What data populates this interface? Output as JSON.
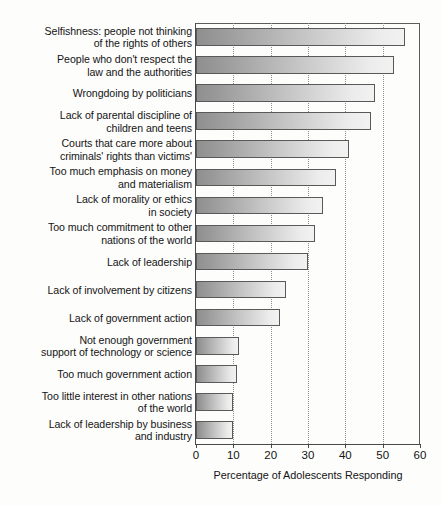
{
  "chart_data": {
    "type": "bar",
    "orientation": "horizontal",
    "title": "",
    "xlabel": "Percentage of Adolescents Responding",
    "ylabel": "",
    "xlim": [
      0,
      60
    ],
    "xticks": [
      0,
      10,
      20,
      30,
      40,
      50,
      60
    ],
    "grid": "vertical dotted gridlines at each tick",
    "legend": "none",
    "categories": [
      "Selfishness: people not thinking\nof the rights of others",
      "People who don't respect the\nlaw and the authorities",
      "Wrongdoing by politicians",
      "Lack of parental discipline of\nchildren and teens",
      "Courts that care more about\ncriminals' rights than victims'",
      "Too much emphasis on money\nand materialism",
      "Lack of morality or ethics\nin society",
      "Too much commitment to other\nnations of the world",
      "Lack of leadership",
      "Lack of involvement by citizens",
      "Lack of government action",
      "Not enough government\nsupport of technology or science",
      "Too much government action",
      "Too little interest in other nations\nof the world",
      "Lack of leadership by business\nand industry"
    ],
    "values": [
      56,
      53,
      48,
      47,
      41,
      37.5,
      34,
      32,
      30,
      24,
      22.5,
      11.5,
      11,
      10,
      10
    ]
  },
  "axis": {
    "tick_labels": [
      "0",
      "10",
      "20",
      "30",
      "40",
      "50",
      "60"
    ],
    "x_title": "Percentage of Adolescents Responding"
  },
  "style": {
    "bar_border": "#595959",
    "bar_gradient_start": "#8f8f8f",
    "bar_gradient_end": "#f2f2f2",
    "axis_color": "#4a4a4a",
    "grid_color": "#8e8e8e",
    "text_color": "#141414",
    "background": "#fdfdfc"
  }
}
